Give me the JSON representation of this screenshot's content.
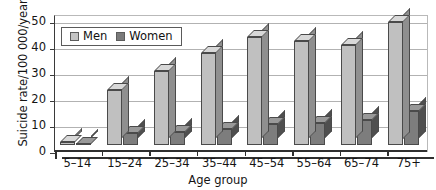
{
  "chart_data": {
    "type": "bar",
    "title": "",
    "xlabel": "Age group",
    "ylabel": "Suicide rate/100 000/year",
    "categories": [
      "5–14",
      "15–24",
      "25–34",
      "35–44",
      "45–54",
      "55–64",
      "65–74",
      "75+"
    ],
    "series": [
      {
        "name": "Men",
        "color": "#c0c0c0",
        "values": [
          1,
          21,
          28.5,
          35.5,
          41.5,
          40,
          38.5,
          47.5
        ]
      },
      {
        "name": "Women",
        "color": "#7d7d7d",
        "values": [
          0.3,
          4.5,
          5,
          6,
          8,
          8.5,
          9.5,
          13
        ]
      }
    ],
    "ylim": [
      0,
      50
    ],
    "yticks": [
      0,
      10,
      20,
      30,
      40,
      50
    ],
    "ytick_labels": [
      "0",
      "10",
      "20",
      "30",
      "40",
      "50"
    ],
    "grid": true,
    "legend_position": "top-left-inside",
    "style": "3d-column"
  },
  "legend": {
    "items": [
      {
        "label": "Men",
        "swatch": "men"
      },
      {
        "label": "Women",
        "swatch": "women"
      }
    ]
  }
}
